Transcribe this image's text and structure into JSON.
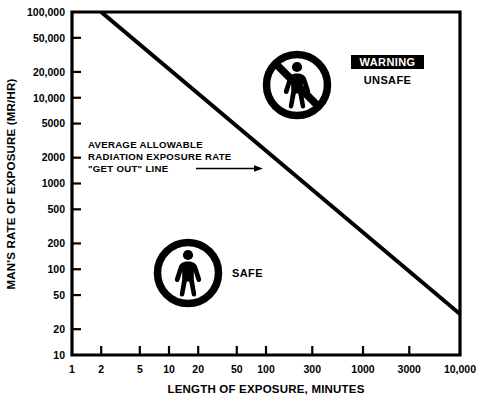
{
  "chart_data": {
    "type": "line",
    "title": "",
    "xlabel": "LENGTH OF EXPOSURE, MINUTES",
    "ylabel": "MAN'S RATE OF EXPOSURE (MR/HR)",
    "xscale": "log",
    "yscale": "log",
    "xlim": [
      1,
      10000
    ],
    "ylim": [
      10,
      100000
    ],
    "grid": false,
    "legend": "none",
    "x_ticks": [
      {
        "value": 1,
        "label": "1"
      },
      {
        "value": 2,
        "label": "2"
      },
      {
        "value": 5,
        "label": "5"
      },
      {
        "value": 10,
        "label": "10"
      },
      {
        "value": 20,
        "label": "20"
      },
      {
        "value": 50,
        "label": "50"
      },
      {
        "value": 100,
        "label": "100"
      },
      {
        "value": 300,
        "label": "300"
      },
      {
        "value": 1000,
        "label": "1000"
      },
      {
        "value": 3000,
        "label": "3000"
      },
      {
        "value": 10000,
        "label": "10,000"
      }
    ],
    "y_ticks": [
      {
        "value": 100000,
        "label": "100,000"
      },
      {
        "value": 50000,
        "label": "50,000"
      },
      {
        "value": 20000,
        "label": "20,000"
      },
      {
        "value": 10000,
        "label": "10,000"
      },
      {
        "value": 5000,
        "label": "5000"
      },
      {
        "value": 2000,
        "label": "2000"
      },
      {
        "value": 1000,
        "label": "1000"
      },
      {
        "value": 500,
        "label": "500"
      },
      {
        "value": 200,
        "label": "200"
      },
      {
        "value": 100,
        "label": "100"
      },
      {
        "value": 50,
        "label": "50"
      },
      {
        "value": 20,
        "label": "20"
      },
      {
        "value": 10,
        "label": "10"
      }
    ],
    "series": [
      {
        "name": "AVERAGE ALLOWABLE RADIATION EXPOSURE RATE \"GET OUT\" LINE",
        "type": "line",
        "color": "#000000",
        "linewidth": 4,
        "points": [
          {
            "x": 2,
            "y": 100000
          },
          {
            "x": 10000,
            "y": 30
          }
        ]
      }
    ],
    "annotations": [
      {
        "name": "get-out-line-annotation",
        "lines": [
          "AVERAGE ALLOWABLE",
          "RADIATION EXPOSURE RATE",
          "\"GET OUT\" LINE"
        ],
        "arrow": true,
        "arrow_direction": "right",
        "target": {
          "x": 150,
          "y": 1700
        }
      },
      {
        "name": "safe-zone",
        "text": "SAFE",
        "region": "below-line"
      },
      {
        "name": "unsafe-zone",
        "text_primary": "WARNING",
        "text_secondary": "UNSAFE",
        "region": "above-line"
      }
    ]
  },
  "axes": {
    "y_title": "MAN'S RATE OF EXPOSURE (MR/HR)",
    "x_title": "LENGTH OF EXPOSURE, MINUTES"
  },
  "annotation": {
    "line1": "AVERAGE ALLOWABLE",
    "line2": "RADIATION EXPOSURE RATE",
    "line3": "\"GET OUT\" LINE"
  },
  "zones": {
    "safe_label": "SAFE",
    "warning_label": "WARNING",
    "unsafe_label": "UNSAFE"
  },
  "colors": {
    "ink": "#000000",
    "paper": "#ffffff",
    "warning_badge_bg": "#000000",
    "warning_badge_text": "#ffffff"
  },
  "icons": {
    "safe": "standing-person-icon",
    "unsafe": "no-person-prohibition-icon"
  }
}
